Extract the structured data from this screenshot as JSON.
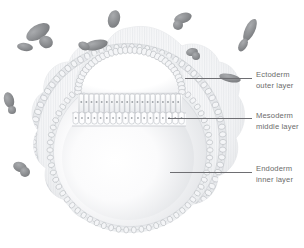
{
  "figure": {
    "background_color": "#ffffff",
    "ink_color": "#6e6e72",
    "text_color": "#6b6b6b",
    "cell_outline_color": "#b8bcc0",
    "cell_fill_color": "#f4f5f7",
    "shading_color": "#d8dadd",
    "migrating_cell_color": "#8d8f92",
    "hatch_color": "#e3e5e8"
  },
  "labels": [
    {
      "id": "ectoderm",
      "line1": "Ectoderm",
      "line2": "outer layer",
      "text_x": 256,
      "text_y": 70,
      "leader_x": 185,
      "leader_y": 78,
      "leader_w": 67
    },
    {
      "id": "mesoderm",
      "line1": "Mesoderm",
      "line2": "middle layer",
      "text_x": 256,
      "text_y": 111,
      "leader_x": 168,
      "leader_y": 118,
      "leader_w": 84
    },
    {
      "id": "endoderm",
      "line1": "Endoderm",
      "line2": "inner layer",
      "text_x": 256,
      "text_y": 164,
      "leader_x": 170,
      "leader_y": 172,
      "leader_w": 82
    }
  ],
  "migrating_cells": [
    {
      "id": "mc-1",
      "cx": 38,
      "cy": 32,
      "rx": 13,
      "ry": 7,
      "rot": -32
    },
    {
      "id": "mc-2",
      "cx": 46,
      "cy": 42,
      "rx": 7,
      "ry": 6,
      "rot": 20
    },
    {
      "id": "mc-3",
      "cx": 25,
      "cy": 47,
      "rx": 8,
      "ry": 4,
      "rot": 8
    },
    {
      "id": "mc-4",
      "cx": 114,
      "cy": 19,
      "rx": 6,
      "ry": 9,
      "rot": 14
    },
    {
      "id": "mc-5",
      "cx": 96,
      "cy": 45,
      "rx": 12,
      "ry": 5,
      "rot": -12
    },
    {
      "id": "mc-6",
      "cx": 84,
      "cy": 46,
      "rx": 6,
      "ry": 4,
      "rot": 25
    },
    {
      "id": "mc-7",
      "cx": 183,
      "cy": 18,
      "rx": 9,
      "ry": 5,
      "rot": -18
    },
    {
      "id": "mc-8",
      "cx": 178,
      "cy": 25,
      "rx": 5,
      "ry": 5,
      "rot": 0
    },
    {
      "id": "mc-9",
      "cx": 250,
      "cy": 30,
      "rx": 5,
      "ry": 12,
      "rot": 25
    },
    {
      "id": "mc-10",
      "cx": 243,
      "cy": 45,
      "rx": 4,
      "ry": 7,
      "rot": 30
    },
    {
      "id": "mc-11",
      "cx": 192,
      "cy": 52,
      "rx": 6,
      "ry": 4,
      "rot": -10
    },
    {
      "id": "mc-12",
      "cx": 196,
      "cy": 56,
      "rx": 4,
      "ry": 4,
      "rot": 0
    },
    {
      "id": "mc-13",
      "cx": 230,
      "cy": 78,
      "rx": 11,
      "ry": 4,
      "rot": 12
    },
    {
      "id": "mc-14",
      "cx": 9,
      "cy": 100,
      "rx": 5,
      "ry": 8,
      "rot": -14
    },
    {
      "id": "mc-15",
      "cx": 12,
      "cy": 110,
      "rx": 4,
      "ry": 4,
      "rot": 0
    },
    {
      "id": "mc-16",
      "cx": 20,
      "cy": 167,
      "rx": 7,
      "ry": 5,
      "rot": 18
    },
    {
      "id": "mc-17",
      "cx": 25,
      "cy": 172,
      "rx": 5,
      "ry": 5,
      "rot": 0
    }
  ],
  "structures": {
    "outer_blastula": {
      "name": "outer-cell-mass",
      "cx": 128,
      "cy": 140,
      "r": 110
    },
    "ectoderm_ring": {
      "name": "ectoderm-cell-ring",
      "cx": 128,
      "cy": 142,
      "r": 95,
      "cell_count": 78
    },
    "endoderm_ring": {
      "name": "endoderm-cell-ring",
      "cx": 130,
      "cy": 150,
      "r": 80,
      "cell_count": 66
    },
    "archenteron_cavity": {
      "name": "inner-cavity",
      "cx": 130,
      "cy": 155,
      "rx": 72,
      "ry": 70
    },
    "ectoderm_dome": {
      "name": "ectoderm-dome-cavity",
      "cx": 130,
      "cy": 78,
      "rx": 53,
      "ry": 27
    },
    "mesoderm_columnar_band": {
      "name": "mesoderm-columnar-band",
      "cell_count": 20,
      "y_top": 96,
      "y_bottom": 112
    },
    "endoderm_columnar_band": {
      "name": "endoderm-columnar-band",
      "cell_count": 18,
      "y_top": 112,
      "y_bottom": 124
    }
  }
}
